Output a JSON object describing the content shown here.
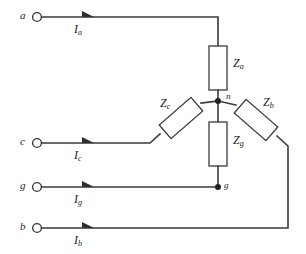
{
  "diagram": {
    "background_color": "#ffffff",
    "line_color": "#3a3a3a"
  },
  "terminals": [
    {
      "name": "a",
      "label": "a",
      "y": 17
    },
    {
      "name": "c",
      "label": "c",
      "y": 143
    },
    {
      "name": "g",
      "label": "g",
      "y": 187
    },
    {
      "name": "b",
      "label": "b",
      "y": 228
    }
  ],
  "currents": [
    {
      "name": "Ia",
      "symbol": "I",
      "subscript": "a"
    },
    {
      "name": "Ic",
      "symbol": "I",
      "subscript": "c"
    },
    {
      "name": "Ig",
      "symbol": "I",
      "subscript": "g"
    },
    {
      "name": "Ib",
      "symbol": "I",
      "subscript": "b"
    }
  ],
  "impedances": [
    {
      "name": "Za",
      "symbol": "Z",
      "subscript": "a",
      "orientation": "vertical"
    },
    {
      "name": "Zb",
      "symbol": "Z",
      "subscript": "b",
      "orientation": "diagonal-right"
    },
    {
      "name": "Zc",
      "symbol": "Z",
      "subscript": "c",
      "orientation": "diagonal-left"
    },
    {
      "name": "Zg",
      "symbol": "Z",
      "subscript": "g",
      "orientation": "vertical"
    }
  ],
  "nodes": [
    {
      "name": "n",
      "label": "n"
    },
    {
      "name": "g",
      "label": "g"
    }
  ]
}
